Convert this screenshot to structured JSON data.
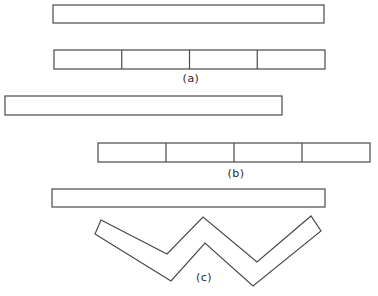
{
  "figure": {
    "background_color": "#ffffff",
    "stroke_color": "#4a4a4a",
    "stroke_width": 1.2,
    "label_color": "#2b2b2b",
    "shapes": [
      {
        "kind": "rect",
        "name": "strip-a-whole",
        "x": 53,
        "y": 5,
        "w": 271,
        "h": 18,
        "segments": 1
      },
      {
        "kind": "rect",
        "name": "strip-a-segmented",
        "x": 54,
        "y": 50,
        "w": 271,
        "h": 19,
        "segments": 4
      },
      {
        "kind": "rect",
        "name": "strip-b-whole",
        "x": 5,
        "y": 96,
        "w": 277,
        "h": 19,
        "segments": 1
      },
      {
        "kind": "rect",
        "name": "strip-b-segmented",
        "x": 98,
        "y": 143,
        "w": 272,
        "h": 19,
        "segments": 4
      },
      {
        "kind": "rect",
        "name": "strip-c-whole",
        "x": 52,
        "y": 189,
        "w": 273,
        "h": 18,
        "segments": 1
      },
      {
        "kind": "polygon",
        "name": "strip-c-zigzag",
        "points": [
          [
            101,
            220
          ],
          [
            167,
            254
          ],
          [
            203,
            217
          ],
          [
            257,
            262
          ],
          [
            311,
            216
          ],
          [
            321,
            231
          ],
          [
            253,
            286
          ],
          [
            205,
            243
          ],
          [
            171,
            281
          ],
          [
            95,
            234
          ]
        ]
      }
    ],
    "labels": [
      {
        "text": "(a)",
        "x": 191,
        "y": 72
      },
      {
        "text": "(b)",
        "x": 236,
        "y": 167
      },
      {
        "text": "(c)",
        "x": 204,
        "y": 271
      }
    ]
  }
}
